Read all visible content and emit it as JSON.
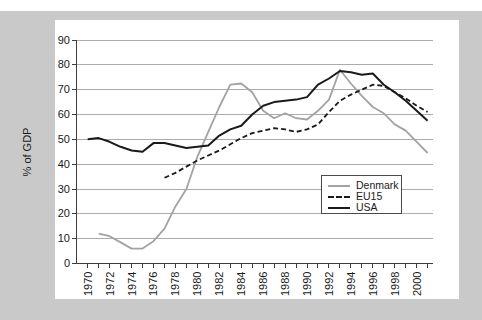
{
  "frame": {
    "backdrop_color": "#c9c9c9",
    "card_color": "#ffffff"
  },
  "chart_data": {
    "type": "line",
    "title": "",
    "xlabel": "",
    "ylabel": "% of GDP",
    "ylim": [
      0,
      90
    ],
    "ytick_step": 10,
    "y_tick_labels": [
      "0",
      "10",
      "20",
      "30",
      "40",
      "50",
      "60",
      "70",
      "80",
      "90"
    ],
    "x_axis": {
      "start_year": 1970,
      "end_year": 2001,
      "tick_every": 1,
      "label_every": 2,
      "labels": [
        "1970",
        "1972",
        "1974",
        "1976",
        "1978",
        "1980",
        "1982",
        "1984",
        "1986",
        "1988",
        "1990",
        "1992",
        "1994",
        "1996",
        "1998",
        "2000"
      ]
    },
    "grid": "horizontal",
    "colors": {
      "gridline": "#ababab",
      "axis": "#3d3d3d",
      "denmark": "#a3a3a3",
      "black": "#1a1a1a"
    },
    "legend": {
      "position": "middle-right",
      "bordered": true,
      "entries": [
        "Denmark",
        "EU15",
        "USA"
      ]
    },
    "series": [
      {
        "name": "Denmark",
        "color": "#a3a3a3",
        "dash": "solid",
        "width": 1.8,
        "start_year": 1971,
        "values": [
          12,
          11,
          8.5,
          6,
          6,
          9,
          14,
          23,
          30,
          43,
          53,
          63,
          72,
          72.5,
          69,
          61.5,
          58.5,
          60.5,
          58.5,
          58,
          61.5,
          66,
          78,
          72.5,
          67.5,
          63,
          60.5,
          56,
          53.5,
          49,
          44.5
        ]
      },
      {
        "name": "EU15",
        "color": "#1a1a1a",
        "dash": "dashed",
        "width": 1.8,
        "start_year": 1977,
        "values": [
          34.5,
          36.5,
          39,
          41.5,
          43.5,
          45.5,
          48,
          50.5,
          52.5,
          53.5,
          54.5,
          54,
          53,
          54,
          56,
          61,
          65.5,
          68,
          70,
          72,
          71.5,
          69,
          66.5,
          63.5,
          61
        ]
      },
      {
        "name": "USA",
        "color": "#1a1a1a",
        "dash": "solid",
        "width": 2,
        "start_year": 1970,
        "values": [
          50,
          50.5,
          49,
          47,
          45.5,
          45,
          48.5,
          48.5,
          47.5,
          46.5,
          47,
          47.5,
          51.5,
          54,
          55.5,
          60,
          63.5,
          65,
          65.5,
          66,
          67,
          72,
          74.5,
          77.5,
          77,
          76,
          76.5,
          72,
          69,
          65.5,
          61.5,
          57.5
        ]
      }
    ]
  }
}
